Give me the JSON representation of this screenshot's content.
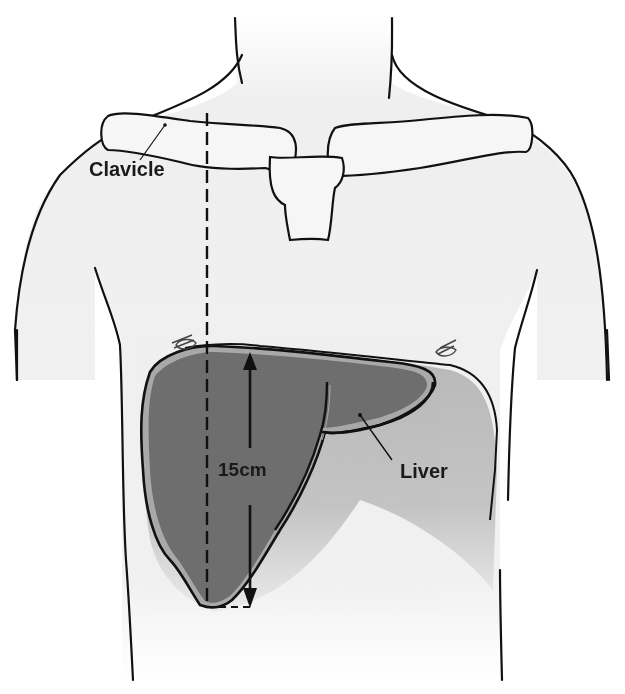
{
  "figure": {
    "labels": {
      "clavicle": "Clavicle",
      "measurement": "15cm",
      "liver": "Liver"
    },
    "measurement": {
      "value": 15,
      "unit": "cm",
      "line": "midclavicular"
    },
    "colors": {
      "background": "#ffffff",
      "skin": "#f1f1f1",
      "outline": "#111111",
      "liver_fill": "#6e6e6e",
      "liver_shadow": "#bdbdbd",
      "liver_rim": "#a9a9a9"
    }
  }
}
